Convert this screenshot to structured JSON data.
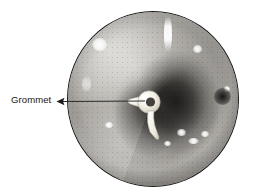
{
  "figure": {
    "type": "otoscopic-photograph",
    "background_color": "#ffffff"
  },
  "photo": {
    "shape": "circle",
    "border_color": "#1b1b1b",
    "center_x": 153,
    "center_y": 99,
    "radius": 86,
    "tone": "grayscale",
    "base_color": "#a8a5a0",
    "shadow_color": "#1c1b19",
    "highlight_color": "#ffffff",
    "highlights": [
      {
        "name": "upper-left-glint",
        "x": 31,
        "y": 32,
        "w": 13,
        "h": 11
      },
      {
        "name": "upper-vertical-streak",
        "x": 99,
        "y": 6,
        "w": 7,
        "h": 32
      },
      {
        "name": "upper-right-glint",
        "x": 128,
        "y": 36,
        "w": 7,
        "h": 7
      },
      {
        "name": "right-rim-glint",
        "x": 158,
        "y": 76,
        "w": 5,
        "h": 5
      },
      {
        "name": "lower-right-glint-a",
        "x": 112,
        "y": 119,
        "w": 7,
        "h": 6
      },
      {
        "name": "lower-right-glint-b",
        "x": 123,
        "y": 128,
        "w": 9,
        "h": 5
      },
      {
        "name": "lower-right-glint-c",
        "x": 135,
        "y": 121,
        "w": 6,
        "h": 5
      },
      {
        "name": "lower-right-glint-d",
        "x": 98,
        "y": 131,
        "w": 5,
        "h": 4
      },
      {
        "name": "lower-left-glint",
        "x": 40,
        "y": 112,
        "w": 6,
        "h": 5
      }
    ],
    "dark_spots": [
      {
        "name": "right-canal-pit",
        "x": 150,
        "y": 80,
        "w": 13,
        "h": 13
      }
    ]
  },
  "grommet": {
    "label": "Grommet",
    "color": "#f5f2e9",
    "shade_color": "#b9b5a8",
    "ring_center_x": 81,
    "ring_center_y": 90,
    "ring_outer_r": 11,
    "ring_inner_r": 4.5,
    "description": "white ventilation tube with flange and tail"
  },
  "annotation": {
    "label_text": "Grommet",
    "label_color": "#141414",
    "leader_color": "#2b2b2b",
    "leader_from_x": 62,
    "leader_from_y": 102,
    "leader_to_x": 145,
    "leader_to_y": 101,
    "arrow_direction": "left"
  }
}
